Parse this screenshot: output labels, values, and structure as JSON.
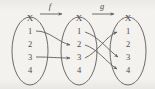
{
  "figure": {
    "type": "function-composition-diagram",
    "background_color": "#f4f2ef",
    "ink_color": "#5e5e5e",
    "width": 155,
    "height": 89
  },
  "sets": [
    {
      "id": "domain",
      "label": "X",
      "elements": [
        "1",
        "2",
        "3",
        "4"
      ]
    },
    {
      "id": "middle",
      "label": "X",
      "elements": [
        "1",
        "2",
        "3",
        "4"
      ]
    },
    {
      "id": "codomain",
      "label": "X",
      "elements": [
        "1",
        "2",
        "3",
        "4"
      ]
    }
  ],
  "functions": [
    {
      "id": "f",
      "label": "f",
      "from": "domain",
      "to": "middle",
      "mappings": [
        {
          "from": "1",
          "to": "2"
        },
        {
          "from": "3",
          "to": "3"
        }
      ]
    },
    {
      "id": "g",
      "label": "g",
      "from": "middle",
      "to": "codomain",
      "mappings": [
        {
          "from": "1",
          "to": "3"
        },
        {
          "from": "2",
          "to": "4"
        },
        {
          "from": "3",
          "to": "1"
        }
      ]
    }
  ]
}
